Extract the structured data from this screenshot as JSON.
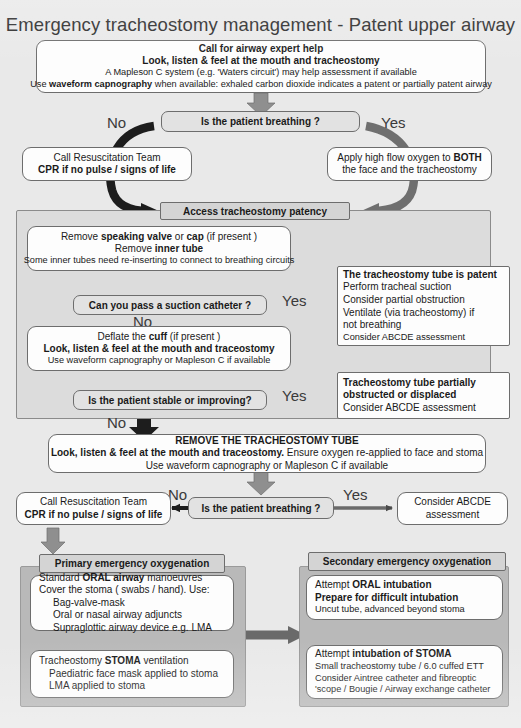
{
  "title": "Emergency tracheostomy management - Patent upper airway",
  "top_box": {
    "line1": "Call for airway expert help",
    "line2": "Look, listen & feel at the mouth and tracheostomy",
    "line3": "A Mapleson C system (e.g. 'Waters circuit') may help assessment if available",
    "line4_a": "Use ",
    "line4_b": "waveform capnography",
    "line4_c": " when available: exhaled carbon dioxide indicates a patent or partially patent airway"
  },
  "decision_breathing_1": "Is the patient breathing ?",
  "label_no_1": "No",
  "label_yes_1": "Yes",
  "resus_box_1": {
    "line1": "Call Resuscitation Team",
    "line2": "CPR if no pulse / signs of life"
  },
  "oxygen_box": {
    "line1_a": "Apply high flow oxygen to ",
    "line1_b": "BOTH",
    "line2": "the face and the tracheostomy"
  },
  "access_header": "Access tracheostomy patency",
  "remove_box": {
    "line1_a": "Remove ",
    "line1_b": "speaking valve",
    "line1_c": " or ",
    "line1_d": "cap",
    "line1_e": " (if present )",
    "line2_a": "Remove ",
    "line2_b": "inner tube",
    "line3": "Some inner tubes need re-inserting to connect to breathing circuits"
  },
  "decision_suction": "Can you pass a suction catheter ?",
  "label_yes_suction": "Yes",
  "label_no_suction": "No",
  "patent_box": {
    "line1": "The tracheostomy tube is patent",
    "line2": "Perform tracheal suction",
    "line3": "Consider partial obstruction",
    "line4": "Ventilate (via tracheostomy) if",
    "line5": "not breathing",
    "line6": "Consider ABCDE assessment"
  },
  "deflate_box": {
    "line1_a": "Deflate the ",
    "line1_b": "cuff",
    "line1_c": " (if present )",
    "line2": "Look, listen & feel at the mouth and traceostomy",
    "line3": "Use waveform capnography or Mapleson C if available"
  },
  "decision_stable": "Is the patient stable or improving?",
  "label_yes_stable": "Yes",
  "label_no_stable": "No",
  "obstructed_box": {
    "line1": "Tracheostomy tube partially",
    "line2": "obstructed or displaced",
    "line3": "Consider ABCDE assessment"
  },
  "remove_tube_box": {
    "line1": "REMOVE THE TRACHEOSTOMY TUBE",
    "line2_a": "Look, listen & feel at the mouth and traceostomy.",
    "line2_b": " Ensure oxygen re-applied to face and stoma",
    "line3": "Use waveform capnography or Mapleson C if available"
  },
  "decision_breathing_2": "Is the patient breathing ?",
  "label_no_2": "No",
  "label_yes_2": "Yes",
  "resus_box_2": {
    "line1": "Call Resuscitation Team",
    "line2": "CPR if no pulse / signs of life"
  },
  "abcde_box": {
    "line1": "Consider ABCDE",
    "line2": "assessment"
  },
  "primary_header": "Primary emergency oxygenation",
  "primary_box_1": {
    "line1_a": "Standard ",
    "line1_b": "ORAL airway",
    "line1_c": " manoeuvres",
    "line2": "Cover the stoma ( swabs / hand). Use:",
    "line3": "Bag-valve-mask",
    "line4": "Oral or nasal airway adjuncts",
    "line5": "Supraglottic airway device e.g. LMA"
  },
  "primary_box_2": {
    "line1_a": "Tracheostomy ",
    "line1_b": "STOMA",
    "line1_c": " ventilation",
    "line2": "Paediatric face mask applied to stoma",
    "line3": "LMA applied to stoma"
  },
  "secondary_header": "Secondary emergency oxygenation",
  "secondary_box_1": {
    "line1_a": "Attempt ",
    "line1_b": "ORAL intubation",
    "line2": "Prepare for difficult intubation",
    "line3": "Uncut tube, advanced beyond stoma"
  },
  "secondary_box_2": {
    "line1_a": "Attempt ",
    "line1_b": "intubation of STOMA",
    "line2": "Small tracheostomy tube / 6.0 cuffed ETT",
    "line3": "Consider Aintree catheter and fibreoptic",
    "line4": "'scope / Bougie / Airway exchange catheter"
  },
  "colors": {
    "page_background": "#e9e9e9",
    "box_fill": "#fdfdfd",
    "box_border": "#6d6d6d",
    "decision_fill": "#e2e2e2",
    "header_bar_fill": "#d4d4d4",
    "panel_fill": "#dcdcdc",
    "panel_dark_fill": "#b9b9b9",
    "arrow_gray": "#8a8a8a",
    "arrow_dark": "#555555",
    "arrow_black": "#1d1d1d",
    "text": "#1a1a1a"
  }
}
